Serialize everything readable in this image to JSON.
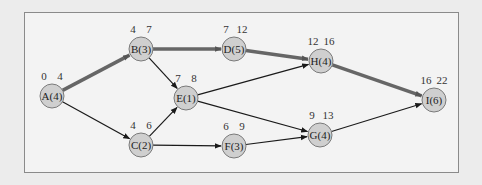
{
  "diagram": {
    "type": "activity-network",
    "colors": {
      "node_fill": "#cfcfcf",
      "node_stroke": "#7a7a7a",
      "edge_normal": "#1a1a1a",
      "edge_critical": "#666666",
      "frame_border": "#8a8a8a"
    },
    "nodes": [
      {
        "id": "A",
        "label": "A(4)",
        "es": "0",
        "ef": "4",
        "cx": 52,
        "cy": 96
      },
      {
        "id": "B",
        "label": "B(3)",
        "es": "4",
        "ef": "7",
        "cx": 141,
        "cy": 49
      },
      {
        "id": "C",
        "label": "C(2)",
        "es": "4",
        "ef": "6",
        "cx": 141,
        "cy": 145
      },
      {
        "id": "D",
        "label": "D(5)",
        "es": "7",
        "ef": "12",
        "cx": 234,
        "cy": 49
      },
      {
        "id": "E",
        "label": "E(1)",
        "es": "7",
        "ef": "8",
        "cx": 186,
        "cy": 98
      },
      {
        "id": "F",
        "label": "F(3)",
        "es": "6",
        "ef": "9",
        "cx": 234,
        "cy": 146
      },
      {
        "id": "G",
        "label": "G(4)",
        "es": "9",
        "ef": "13",
        "cx": 320,
        "cy": 135
      },
      {
        "id": "H",
        "label": "H(4)",
        "es": "12",
        "ef": "16",
        "cx": 321,
        "cy": 61
      },
      {
        "id": "I",
        "label": "I(6)",
        "es": "16",
        "ef": "22",
        "cx": 434,
        "cy": 100
      }
    ],
    "edges": [
      {
        "from": "A",
        "to": "B",
        "critical": true
      },
      {
        "from": "A",
        "to": "C",
        "critical": false
      },
      {
        "from": "B",
        "to": "D",
        "critical": true
      },
      {
        "from": "B",
        "to": "E",
        "critical": false
      },
      {
        "from": "C",
        "to": "E",
        "critical": false
      },
      {
        "from": "C",
        "to": "F",
        "critical": false
      },
      {
        "from": "D",
        "to": "H",
        "critical": true
      },
      {
        "from": "E",
        "to": "H",
        "critical": false
      },
      {
        "from": "E",
        "to": "G",
        "critical": false
      },
      {
        "from": "F",
        "to": "G",
        "critical": false
      },
      {
        "from": "H",
        "to": "I",
        "critical": true
      },
      {
        "from": "G",
        "to": "I",
        "critical": false
      }
    ]
  }
}
